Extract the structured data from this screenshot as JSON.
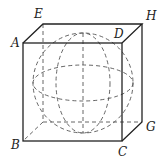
{
  "figure": {
    "vertices": {
      "A": {
        "label": "A",
        "x": 23,
        "y": 43
      },
      "D": {
        "label": "D",
        "x": 122,
        "y": 43
      },
      "E": {
        "label": "E",
        "x": 43,
        "y": 24
      },
      "H": {
        "label": "H",
        "x": 142,
        "y": 24
      },
      "B": {
        "label": "B",
        "x": 23,
        "y": 141
      },
      "C": {
        "label": "C",
        "x": 122,
        "y": 141
      },
      "G": {
        "label": "G",
        "x": 142,
        "y": 122
      }
    },
    "sphere": {
      "cx": 83,
      "cy": 83,
      "r": 50
    },
    "colors": {
      "line": "#222222",
      "dashed": "#555555",
      "background": "#ffffff"
    }
  }
}
